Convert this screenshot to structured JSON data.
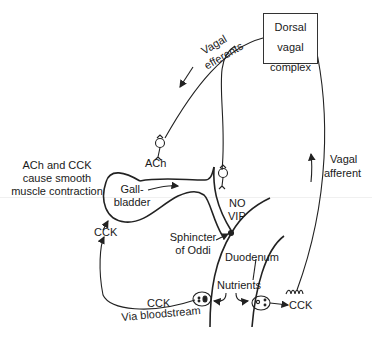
{
  "diagram": {
    "type": "physiology-pathway",
    "nodes": {
      "dvc": {
        "label_lines": [
          "Dorsal",
          "vagal",
          "complex"
        ]
      },
      "gallbladder": {
        "label_lines": [
          "Gall-",
          "bladder"
        ]
      },
      "sphincter": {
        "label_lines": [
          "Sphincter",
          "of Oddi"
        ]
      },
      "duodenum": {
        "label": "Duodenum"
      },
      "nutrients": {
        "label": "Nutrients"
      }
    },
    "labels": {
      "vagal_efferents": [
        "Vagal",
        "efferents"
      ],
      "vagal_afferent": [
        "Vagal",
        "afferent"
      ],
      "ach": "ACh",
      "no": "NO",
      "vip": "VIP",
      "cck_gallbladder": "CCK",
      "cck_bloodstream": "CCK",
      "via_bloodstream": "Via bloodstream",
      "cck_right": "CCK",
      "note_lines": [
        "ACh and CCK",
        "cause smooth",
        "muscle contraction"
      ]
    },
    "edges": [
      {
        "from": "Dorsal vagal complex",
        "to": "Gallbladder",
        "via": "Vagal efferents",
        "transmitter": "ACh"
      },
      {
        "from": "Dorsal vagal complex",
        "to": "Sphincter of Oddi",
        "via": "Vagal efferents",
        "transmitter": "NO / VIP"
      },
      {
        "from": "Duodenum (I cell)",
        "to": "Gallbladder",
        "via": "Via bloodstream",
        "signal": "CCK"
      },
      {
        "from": "Duodenum (CCK)",
        "to": "Dorsal vagal complex",
        "via": "Vagal afferent"
      },
      {
        "from": "Nutrients",
        "to": "Duodenal endocrine cells"
      }
    ],
    "colors": {
      "line": "#222222",
      "text": "#1a1a1a",
      "background": "#ffffff"
    }
  }
}
